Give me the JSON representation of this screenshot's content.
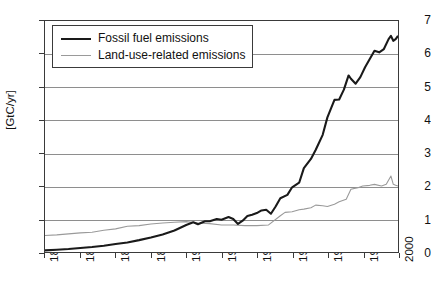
{
  "chart_data": {
    "type": "line",
    "title": "",
    "xlabel": "",
    "ylabel": "[GtC/yr]",
    "xlim": [
      1850,
      2000
    ],
    "ylim": [
      0,
      7
    ],
    "grid": true,
    "legend_position": "top-left",
    "y_ticks": [
      "0",
      "1",
      "2",
      "3",
      "4",
      "5",
      "6",
      "7"
    ],
    "x_ticks": [
      "1850",
      "1865",
      "1880",
      "1895",
      "1910",
      "1925",
      "1940",
      "1955",
      "1970",
      "1985",
      "2000"
    ],
    "colors": {
      "fossil": "#1a1a1a",
      "land_use": "#9a9a9a",
      "grid": "#8e8e8e",
      "frame": "#3a3a3a"
    },
    "series": [
      {
        "name": "Fossil fuel emissions",
        "color": "#1a1a1a",
        "x": [
          1850,
          1855,
          1860,
          1865,
          1870,
          1875,
          1880,
          1885,
          1890,
          1895,
          1900,
          1905,
          1910,
          1913,
          1915,
          1918,
          1920,
          1923,
          1925,
          1928,
          1930,
          1932,
          1934,
          1936,
          1938,
          1940,
          1942,
          1944,
          1946,
          1948,
          1950,
          1953,
          1955,
          1958,
          1960,
          1963,
          1965,
          1968,
          1970,
          1973,
          1975,
          1977,
          1979,
          1980,
          1982,
          1984,
          1986,
          1988,
          1990,
          1992,
          1994,
          1996,
          1997,
          1998,
          1999,
          2000
        ],
        "values": [
          0.05,
          0.07,
          0.09,
          0.12,
          0.15,
          0.19,
          0.24,
          0.29,
          0.36,
          0.44,
          0.53,
          0.65,
          0.82,
          0.9,
          0.84,
          0.93,
          0.93,
          1.0,
          0.98,
          1.06,
          1.0,
          0.85,
          0.95,
          1.09,
          1.13,
          1.18,
          1.26,
          1.28,
          1.16,
          1.38,
          1.63,
          1.73,
          1.96,
          2.1,
          2.54,
          2.82,
          3.09,
          3.55,
          4.08,
          4.61,
          4.62,
          4.92,
          5.35,
          5.25,
          5.1,
          5.3,
          5.6,
          5.85,
          6.1,
          6.05,
          6.15,
          6.45,
          6.55,
          6.4,
          6.45,
          6.55
        ]
      },
      {
        "name": "Land-use-related emissions",
        "color": "#9a9a9a",
        "x": [
          1850,
          1855,
          1860,
          1865,
          1870,
          1875,
          1880,
          1885,
          1890,
          1895,
          1900,
          1905,
          1910,
          1915,
          1920,
          1925,
          1930,
          1935,
          1940,
          1945,
          1950,
          1952,
          1955,
          1958,
          1960,
          1963,
          1965,
          1968,
          1970,
          1973,
          1975,
          1978,
          1980,
          1983,
          1985,
          1988,
          1990,
          1993,
          1995,
          1997,
          1998,
          1999,
          2000
        ],
        "values": [
          0.5,
          0.52,
          0.55,
          0.58,
          0.6,
          0.66,
          0.7,
          0.78,
          0.8,
          0.85,
          0.88,
          0.9,
          0.92,
          0.88,
          0.86,
          0.82,
          0.82,
          0.8,
          0.8,
          0.82,
          1.1,
          1.2,
          1.22,
          1.28,
          1.3,
          1.34,
          1.42,
          1.4,
          1.38,
          1.45,
          1.52,
          1.6,
          1.9,
          1.95,
          2.0,
          2.02,
          2.05,
          2.0,
          2.05,
          2.3,
          2.05,
          2.02,
          2.0
        ]
      }
    ]
  }
}
